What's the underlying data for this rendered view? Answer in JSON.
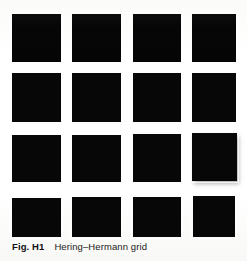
{
  "figure": {
    "caption_label": "Fig. H1",
    "caption_text": "Hering–Hermann grid",
    "background_color": "#fdfdfc",
    "square_color": "#070707",
    "gap_color": "#ffffff"
  },
  "chart_data": {
    "type": "heatmap",
    "title": "Hering–Hermann grid",
    "xlabel": "",
    "ylabel": "",
    "rows": 4,
    "columns": 4,
    "cell_color": "#070707",
    "gap_color": "#ffffff",
    "categories": [
      "col 1",
      "col 2",
      "col 3",
      "col 4"
    ],
    "row_labels": [
      "row 1",
      "row 2",
      "row 3",
      "row 4"
    ],
    "values": [
      [
        1,
        1,
        1,
        1
      ],
      [
        1,
        1,
        1,
        1
      ],
      [
        1,
        1,
        1,
        1
      ],
      [
        1,
        1,
        1,
        1
      ]
    ],
    "squares": [
      {
        "row": 1,
        "col": 1,
        "x": 12,
        "y": 14,
        "w": 49,
        "h": 48,
        "shadow": false,
        "soft_top": true
      },
      {
        "row": 1,
        "col": 2,
        "x": 72,
        "y": 14,
        "w": 49,
        "h": 48,
        "shadow": false,
        "soft_top": true
      },
      {
        "row": 1,
        "col": 3,
        "x": 133,
        "y": 14,
        "w": 48,
        "h": 48,
        "shadow": false,
        "soft_top": true
      },
      {
        "row": 1,
        "col": 4,
        "x": 192,
        "y": 14,
        "w": 44,
        "h": 48,
        "shadow": false,
        "soft_top": true
      },
      {
        "row": 2,
        "col": 1,
        "x": 12,
        "y": 73,
        "w": 49,
        "h": 49,
        "shadow": false,
        "soft_top": false
      },
      {
        "row": 2,
        "col": 2,
        "x": 72,
        "y": 73,
        "w": 49,
        "h": 49,
        "shadow": false,
        "soft_top": false
      },
      {
        "row": 2,
        "col": 3,
        "x": 133,
        "y": 73,
        "w": 48,
        "h": 49,
        "shadow": false,
        "soft_top": false
      },
      {
        "row": 2,
        "col": 4,
        "x": 192,
        "y": 73,
        "w": 44,
        "h": 49,
        "shadow": false,
        "soft_top": false
      },
      {
        "row": 3,
        "col": 1,
        "x": 12,
        "y": 135,
        "w": 49,
        "h": 47,
        "shadow": false,
        "soft_top": false
      },
      {
        "row": 3,
        "col": 2,
        "x": 72,
        "y": 135,
        "w": 49,
        "h": 47,
        "shadow": false,
        "soft_top": false
      },
      {
        "row": 3,
        "col": 3,
        "x": 133,
        "y": 134,
        "w": 48,
        "h": 48,
        "shadow": false,
        "soft_top": false
      },
      {
        "row": 3,
        "col": 4,
        "x": 192,
        "y": 133,
        "w": 45,
        "h": 48,
        "shadow": true,
        "soft_top": false
      },
      {
        "row": 4,
        "col": 1,
        "x": 12,
        "y": 198,
        "w": 49,
        "h": 39,
        "shadow": false,
        "soft_top": false
      },
      {
        "row": 4,
        "col": 2,
        "x": 72,
        "y": 197,
        "w": 49,
        "h": 40,
        "shadow": false,
        "soft_top": false
      },
      {
        "row": 4,
        "col": 3,
        "x": 133,
        "y": 197,
        "w": 48,
        "h": 40,
        "shadow": false,
        "soft_top": false
      },
      {
        "row": 4,
        "col": 4,
        "x": 193,
        "y": 196,
        "w": 42,
        "h": 41,
        "shadow": false,
        "soft_top": false
      }
    ],
    "legend": [],
    "annotations": [],
    "grid": false
  }
}
